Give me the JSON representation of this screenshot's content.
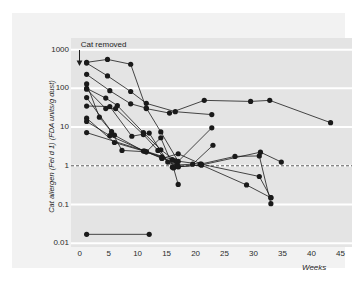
{
  "figure": {
    "background_color": "#f2f2f2",
    "plot_background_color": "#e4e4e4",
    "gridline_color": "#ffffff",
    "series_color": "#1a1a1a",
    "threshold_color": "#555555"
  },
  "annotation": {
    "label": "Cat removed",
    "arrow_icon": "down-arrow-icon",
    "week": 0
  },
  "axis_titles": {
    "y": "Cat allergen (Fel d 1) (FDA units/g dust)",
    "x": "Weeks"
  },
  "chart_data": {
    "type": "line",
    "title": "",
    "subtitle": "",
    "xlabel": "Weeks",
    "ylabel": "Cat allergen (Fel d 1) (FDA units/g dust)",
    "xlim": [
      -1.5,
      47
    ],
    "ylim": [
      0.008,
      2000
    ],
    "yscale": "log",
    "xscale": "linear",
    "grid": true,
    "grid_axis": "y",
    "legend": "none",
    "xticks": [
      0,
      5,
      10,
      15,
      20,
      25,
      30,
      35,
      40,
      45
    ],
    "xticklabels": [
      "0",
      "5",
      "10",
      "15",
      "20",
      "25",
      "30",
      "35",
      "40",
      "45"
    ],
    "yticks": [
      1000,
      100,
      10,
      1,
      0.1,
      0.01
    ],
    "yticklabels": [
      "1000",
      "100",
      "10",
      "1",
      "0.1",
      "0.01"
    ],
    "annotations": [
      {
        "text": "Cat removed",
        "x": 0,
        "y": 1000,
        "marker": "down-arrow"
      }
    ],
    "reference_lines": [
      {
        "y": 1,
        "style": "dashed",
        "label": ""
      }
    ],
    "marker": "filled-circle",
    "series": [
      {
        "name": "home-1",
        "x": [
          1.2,
          4.8,
          8.8,
          11.5,
          15.5,
          21.5,
          29.5,
          32.8,
          43.3
        ],
        "values": [
          470,
          560,
          420,
          30,
          23,
          49,
          46,
          49,
          13
        ]
      },
      {
        "name": "home-2",
        "x": [
          1.2,
          4.8,
          8.8,
          11.5,
          16.5,
          22.8
        ],
        "values": [
          450,
          210,
          83,
          41,
          25,
          21
        ]
      },
      {
        "name": "home-3",
        "x": [
          1.2,
          5.2,
          8.8,
          11.5,
          14.0,
          17.0,
          22.8
        ],
        "values": [
          230,
          87,
          40,
          31,
          7.5,
          1.3,
          9.6
        ]
      },
      {
        "name": "home-4",
        "x": [
          1.2,
          3.4,
          6.0,
          11.0,
          14.2,
          16.8,
          19.5,
          23.0
        ],
        "values": [
          130,
          18,
          6.2,
          2.4,
          1.7,
          1.05,
          1.1,
          3.4
        ]
      },
      {
        "name": "home-5",
        "x": [
          1.2,
          4.5,
          6.5,
          11.0,
          14.0,
          16.5,
          20.8,
          26.8,
          31.0,
          33.0
        ],
        "values": [
          100,
          56,
          36,
          7.2,
          2.6,
          1.35,
          1.1,
          1.75,
          1.8,
          0.105
        ]
      },
      {
        "name": "home-6",
        "x": [
          1.2,
          4.5,
          6.2,
          11.0,
          13.5,
          16.0,
          21.0,
          28.8,
          33.0
        ],
        "values": [
          95,
          30,
          30,
          6.4,
          2.5,
          0.92,
          1.05,
          0.32,
          0.15
        ]
      },
      {
        "name": "home-7",
        "x": [
          1.2,
          5.5,
          7.3,
          11.5,
          14.2,
          17.0,
          21.0,
          31.0,
          33.0
        ],
        "values": [
          58,
          7.6,
          2.5,
          2.3,
          1.55,
          2.05,
          1.1,
          0.53,
          0.15
        ]
      },
      {
        "name": "home-8",
        "x": [
          1.2,
          5.2,
          9.0,
          12.0,
          15.2,
          17.0,
          21.0,
          31.2,
          34.8
        ],
        "values": [
          35,
          34,
          5.8,
          7.0,
          1.25,
          0.95,
          1.05,
          2.25,
          1.25
        ]
      },
      {
        "name": "home-9",
        "x": [
          1.2,
          6.0,
          11.5,
          14.0,
          16.2,
          17.0
        ],
        "values": [
          17,
          4.0,
          2.3,
          5.3,
          0.88,
          0.33
        ]
      },
      {
        "name": "home-10",
        "x": [
          1.2,
          5.2,
          11.2,
          14.2,
          16.8
        ],
        "values": [
          14,
          6.0,
          2.4,
          1.6,
          1.0
        ]
      },
      {
        "name": "home-11",
        "x": [
          1.2,
          12.0
        ],
        "values": [
          0.017,
          0.017
        ]
      },
      {
        "name": "home-12",
        "x": [
          1.2,
          16.0,
          17.0
        ],
        "values": [
          7.2,
          1.45,
          0.95
        ]
      }
    ]
  }
}
